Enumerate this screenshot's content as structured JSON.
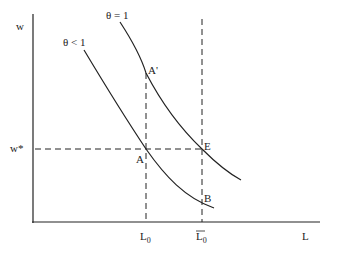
{
  "diagram": {
    "axes": {
      "y_label": "w",
      "x_label": "L"
    },
    "curves": [
      {
        "name": "theta-less-than-1",
        "label": "θ < 1"
      },
      {
        "name": "theta-equals-1",
        "label": "θ = 1"
      }
    ],
    "levels": {
      "wage_star": "w*",
      "L0": "L",
      "L0_sub": "0",
      "L0bar": "L",
      "L0bar_sub": "0"
    },
    "points": {
      "A": "A",
      "A_prime": "A'",
      "E": "E",
      "B": "B"
    }
  }
}
